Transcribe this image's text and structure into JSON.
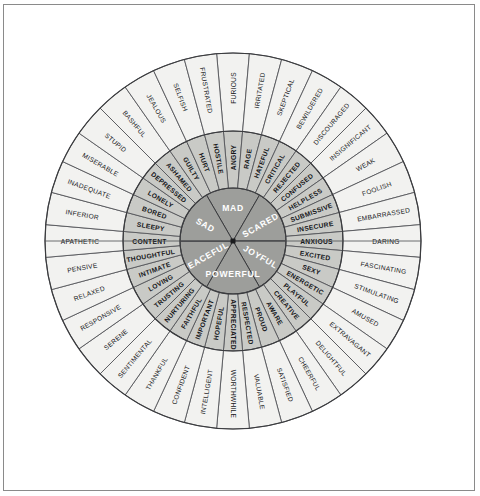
{
  "diagram": {
    "center_dot": true,
    "rings": [
      "core",
      "middle",
      "outer"
    ],
    "colors": {
      "core_fill": "#9d9e9b",
      "middle_fill": "#c9cac6",
      "outer_fill": "#f2f2f0",
      "stroke": "#55565a",
      "core_text": "#ffffff",
      "text": "#16171a",
      "frame": "#8a8a8a"
    }
  },
  "sectors": [
    {
      "core": "MAD",
      "start_deg": -90,
      "end_deg": -30,
      "middle": [
        {
          "label": "ANGRY",
          "outer": [
            "FURIOUS",
            "FRUSTRATED"
          ]
        },
        {
          "label": "HOSTILE",
          "outer": [
            "SELFISH",
            "JEALOUS"
          ]
        },
        {
          "label": "HURT",
          "outer": [
            "BASHFUL",
            "STUPID"
          ]
        },
        {
          "label": "GUILTY",
          "outer": [
            "MISERABLE",
            "INADEQUATE"
          ]
        },
        {
          "label": "RAGE",
          "outer": [
            "IRRITATED",
            "SKEPTICAL"
          ]
        },
        {
          "label": "HATEFUL",
          "outer": [
            "BEWILDERED",
            "DISCOURAGED"
          ]
        }
      ]
    },
    {
      "core": "SCARED",
      "start_deg": -30,
      "end_deg": 30,
      "middle": [
        {
          "label": "CRITICAL",
          "outer": [
            "INSIGNIFICANT",
            "WEAK"
          ]
        },
        {
          "label": "REJECTED",
          "outer": [
            "FOOLISH",
            "EMBARRASSED"
          ]
        },
        {
          "label": "CONFUSED",
          "outer": [
            "DARING",
            "FASCINATING"
          ]
        },
        {
          "label": "HELPLESS",
          "outer": [
            "STIMULATING",
            "AMUSED"
          ]
        },
        {
          "label": "SUBMISSIVE",
          "outer": [
            "EXTRAVAGANT",
            "DELIGHTFUL"
          ]
        },
        {
          "label": "INSECURE",
          "outer": [
            "CHEERFUL",
            "SATISFIED"
          ]
        },
        {
          "label": "ANXIOUS",
          "outer": [
            "VALUABLE",
            "WORTHWHILE"
          ]
        }
      ]
    },
    {
      "core": "JOYFUL",
      "start_deg": 30,
      "end_deg": 90,
      "middle": [
        {
          "label": "EXCITED",
          "outer": []
        },
        {
          "label": "SEXY",
          "outer": []
        },
        {
          "label": "ENERGETIC",
          "outer": []
        },
        {
          "label": "PLAYFUL",
          "outer": []
        },
        {
          "label": "CREATIVE",
          "outer": []
        },
        {
          "label": "AWARE",
          "outer": []
        }
      ]
    },
    {
      "core": "POWERFUL",
      "start_deg": 90,
      "end_deg": 150,
      "middle": [
        {
          "label": "PROUD",
          "outer": []
        },
        {
          "label": "RESPECTED",
          "outer": []
        },
        {
          "label": "APPRECIATED",
          "outer": []
        },
        {
          "label": "HOPEFUL",
          "outer": []
        },
        {
          "label": "IMPORTANT",
          "outer": []
        },
        {
          "label": "FAITHFUL",
          "outer": []
        }
      ]
    },
    {
      "core": "PEACEFUL",
      "start_deg": 150,
      "end_deg": 210,
      "middle": [
        {
          "label": "NURTURING",
          "outer": []
        },
        {
          "label": "TRUSTING",
          "outer": []
        },
        {
          "label": "LOVING",
          "outer": []
        },
        {
          "label": "INTIMATE",
          "outer": []
        },
        {
          "label": "THOUGHTFUL",
          "outer": []
        },
        {
          "label": "CONTENT",
          "outer": []
        }
      ]
    },
    {
      "core": "SAD",
      "start_deg": 210,
      "end_deg": 270,
      "middle": [
        {
          "label": "SLEEPY",
          "outer": []
        },
        {
          "label": "BORED",
          "outer": []
        },
        {
          "label": "LONELY",
          "outer": []
        },
        {
          "label": "DEPRESSED",
          "outer": []
        },
        {
          "label": "ASHAMED",
          "outer": []
        },
        {
          "label": "GUILTY",
          "outer": []
        }
      ]
    }
  ],
  "core_labels": [
    "MAD",
    "SCARED",
    "JOYFUL",
    "POWERFUL",
    "PEACEFUL",
    "SAD"
  ],
  "middle_labels_cw_from_top": [
    "ANGRY",
    "RAGE",
    "HATEFUL",
    "CRITICAL",
    "REJECTED",
    "CONFUSED",
    "HELPLESS",
    "SUBMISSIVE",
    "INSECURE",
    "ANXIOUS",
    "EXCITED",
    "SEXY",
    "ENERGETIC",
    "PLAYFUL",
    "CREATIVE",
    "AWARE",
    "PROUD",
    "RESPECTED",
    "APPRECIATED",
    "HOPEFUL",
    "IMPORTANT",
    "FAITHFUL",
    "NURTURING",
    "TRUSTING",
    "LOVING",
    "INTIMATE",
    "THOUGHTFUL",
    "CONTENT",
    "SLEEPY",
    "BORED",
    "LONELY",
    "DEPRESSED",
    "ASHAMED",
    "GUILTY",
    "HURT",
    "HOSTILE"
  ],
  "outer_labels_cw_from_top": [
    "FURIOUS",
    "IRRITATED",
    "SKEPTICAL",
    "BEWILDERED",
    "DISCOURAGED",
    "INSIGNIFICANT",
    "WEAK",
    "FOOLISH",
    "EMBARRASSED",
    "DARING",
    "FASCINATING",
    "STIMULATING",
    "AMUSED",
    "EXTRAVAGANT",
    "DELIGHTFUL",
    "CHEERFUL",
    "SATISFIED",
    "VALUABLE",
    "WORTHWHILE",
    "INTELLIGENT",
    "CONFIDENT",
    "THANKFUL",
    "SENTIMENTAL",
    "SERENE",
    "RESPONSIVE",
    "RELAXED",
    "PENSIVE",
    "APATHETIC",
    "INFERIOR",
    "INADEQUATE",
    "MISERABLE",
    "STUPID",
    "BASHFUL",
    "JEALOUS",
    "SELFISH",
    "FRUSTRATED"
  ],
  "geometry": {
    "cx": 233,
    "cy": 241,
    "r_core": 53,
    "r_mid": 110,
    "r_outer": 188,
    "core_segments": 6,
    "middle_segments": 36,
    "outer_segments": 36
  }
}
